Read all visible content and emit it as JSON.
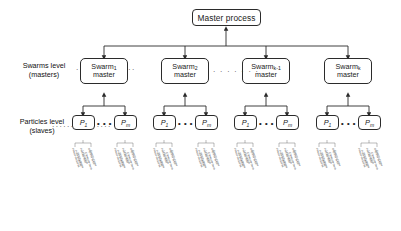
{
  "diagram": {
    "title_node": "Master process",
    "levels": [
      {
        "name": "swarms-level",
        "line1": "Swarms level",
        "line2": "(masters)"
      },
      {
        "name": "particles-level",
        "line1": "Particles level",
        "line2": "(slaves)"
      }
    ],
    "swarms": [
      {
        "label": "Swarm",
        "sub": "1",
        "line2": "master"
      },
      {
        "label": "Swarm",
        "sub": "2",
        "line2": "master"
      },
      {
        "label": "Swarm",
        "sub": "k-1",
        "line2": "master"
      },
      {
        "label": "Swarm",
        "sub": "k",
        "line2": "master"
      }
    ],
    "particles": [
      {
        "label": "P",
        "sub": "1"
      },
      {
        "label": "P",
        "sub": "m"
      }
    ],
    "particle_ellipsis": "• • •",
    "swarm_ellipsis": "· · · · · · ·",
    "leader_dots": "················",
    "micro_labels": [
      "Fitness evaluation",
      "Position update",
      "Velocity update",
      "Personal best",
      "Local search",
      "Constraint check",
      "Objective value",
      "Send to master"
    ],
    "colors": {
      "stroke": "#2b2b2b",
      "box_fill": "#ffffff",
      "text": "#1a1a1a",
      "background": "#ffffff",
      "micro_text": "#3a3a3a"
    }
  }
}
